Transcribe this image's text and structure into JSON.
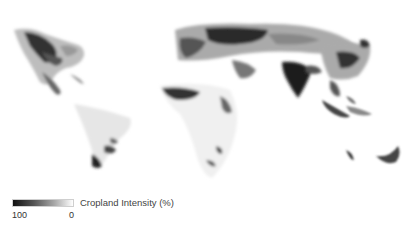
{
  "map": {
    "type": "choropleth-raster",
    "subject": "Global cropland intensity",
    "colors": {
      "high": "#111111",
      "low": "#ffffff"
    }
  },
  "legend": {
    "title": "Cropland Intensity (%)",
    "max_label": "100",
    "min_label": "0"
  }
}
